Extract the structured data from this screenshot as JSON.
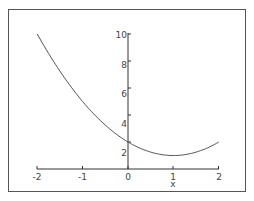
{
  "chart_data": {
    "type": "line",
    "title": "",
    "xlabel": "x",
    "ylabel": "",
    "xlim": [
      -2,
      2
    ],
    "ylim": [
      0,
      10
    ],
    "x_ticks": [
      "-2",
      "-1",
      "0",
      "1",
      "2"
    ],
    "y_ticks": [
      "2",
      "4",
      "6",
      "8",
      "10"
    ],
    "grid": false,
    "legend": null,
    "series": [
      {
        "name": "x^2 - 2x + 2",
        "x": [
          -2,
          -1.5,
          -1,
          -0.5,
          0,
          0.5,
          1,
          1.5,
          2
        ],
        "values": [
          10,
          7.25,
          5,
          3.25,
          2,
          1.25,
          1,
          1.25,
          2
        ]
      }
    ]
  },
  "colors": {
    "axis": "#333333",
    "curve": "#555555",
    "frame": "#555555",
    "text": "#444444"
  }
}
